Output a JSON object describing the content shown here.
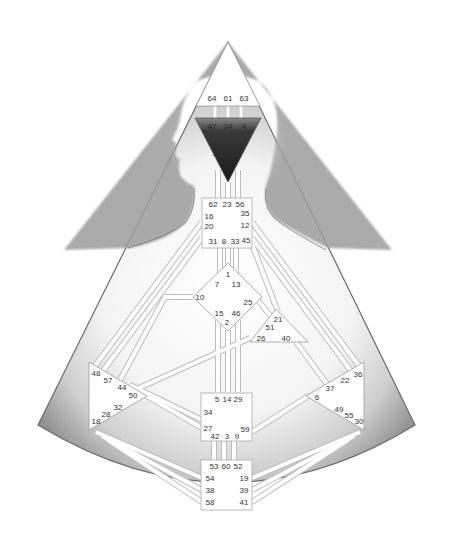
{
  "colors": {
    "background": "#ffffff",
    "outer_shade": "#9a9a9a",
    "inner_light": "#f2f2f2",
    "center_fill": "#ffffff",
    "center_stroke": "#aaaaaa",
    "ajna_fill": "#2b2b2b",
    "silhouette": "#b5b5b5",
    "channel": "#ffffff",
    "channel_edge": "#bbbbbb",
    "text": "#333333"
  },
  "centers": {
    "head": {
      "name": "Head",
      "gates": [
        "64",
        "61",
        "63"
      ]
    },
    "ajna": {
      "name": "Ajna",
      "gates": [
        "47",
        "24",
        "4",
        "17"
      ]
    },
    "throat": {
      "name": "Throat",
      "gates": [
        "62",
        "23",
        "56",
        "16",
        "35",
        "20",
        "12",
        "31",
        "8",
        "33",
        "45"
      ]
    },
    "g": {
      "name": "G Center",
      "gates": [
        "1",
        "7",
        "13",
        "10",
        "25",
        "15",
        "46",
        "2"
      ]
    },
    "heart": {
      "name": "Heart",
      "gates": [
        "21",
        "51",
        "26",
        "40"
      ]
    },
    "spleen": {
      "name": "Spleen",
      "gates": [
        "48",
        "57",
        "44",
        "50",
        "32",
        "28",
        "18"
      ]
    },
    "solar_plexus": {
      "name": "Solar Plexus",
      "gates": [
        "36",
        "22",
        "37",
        "6",
        "49",
        "55",
        "30"
      ]
    },
    "sacral": {
      "name": "Sacral",
      "gates": [
        "5",
        "14",
        "29",
        "34",
        "27",
        "59",
        "42",
        "3",
        "9"
      ]
    },
    "root": {
      "name": "Root",
      "gates": [
        "53",
        "60",
        "52",
        "54",
        "19",
        "38",
        "39",
        "58",
        "41"
      ]
    }
  }
}
